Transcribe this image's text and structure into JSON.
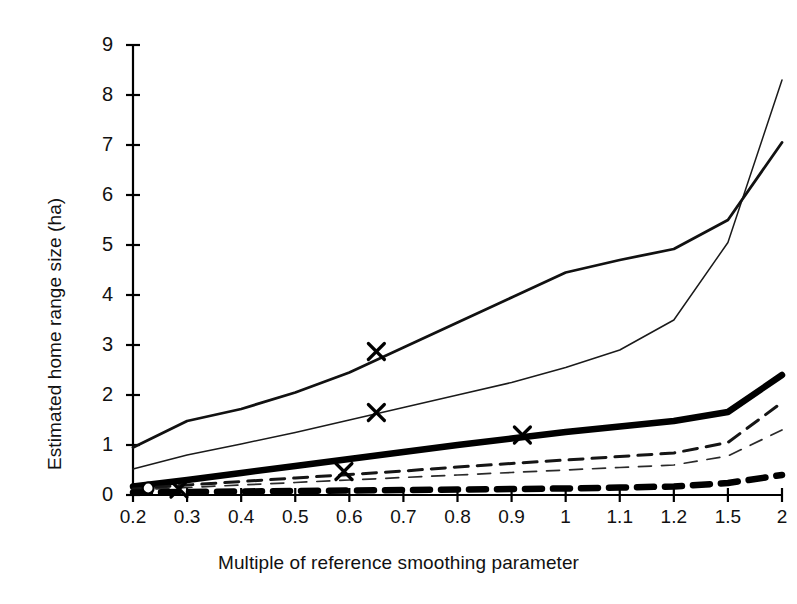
{
  "chart_data": {
    "type": "line",
    "title": "",
    "xlabel": "Multiple of reference smoothing parameter",
    "ylabel": "Estimated home range size (ha)",
    "categories": [
      "0.2",
      "0.3",
      "0.4",
      "0.5",
      "0.6",
      "0.7",
      "0.8",
      "0.9",
      "1",
      "1.1",
      "1.2",
      "1.5",
      "2"
    ],
    "x_tick_labels": [
      "0.2",
      "0.3",
      "0.4",
      "0.5",
      "0.6",
      "0.7",
      "0.8",
      "0.9",
      "1",
      "1.1",
      "1.2",
      "1.5",
      "2"
    ],
    "y_tick_labels": [
      "0",
      "1",
      "2",
      "3",
      "4",
      "5",
      "6",
      "7",
      "8",
      "9"
    ],
    "ylim": [
      0,
      9
    ],
    "ytick_step": 1,
    "grid": false,
    "legend": "none",
    "axis_color": "#000000",
    "series": [
      {
        "name": "thin-solid-steep",
        "style": "solid",
        "width": "thin",
        "color": "#1a1a1a",
        "values": [
          0.52,
          0.8,
          1.02,
          1.25,
          1.5,
          1.75,
          2.0,
          2.25,
          2.55,
          2.9,
          3.5,
          5.05,
          8.3
        ]
      },
      {
        "name": "medium-solid-upper",
        "style": "solid",
        "width": "medium",
        "color": "#111111",
        "values": [
          0.95,
          1.48,
          1.72,
          2.05,
          2.45,
          2.95,
          3.45,
          3.95,
          4.45,
          4.7,
          4.92,
          5.5,
          7.05
        ]
      },
      {
        "name": "thick-solid-middle",
        "style": "solid",
        "width": "thick",
        "color": "#000000",
        "values": [
          0.17,
          0.3,
          0.44,
          0.58,
          0.72,
          0.86,
          1.0,
          1.13,
          1.26,
          1.37,
          1.48,
          1.66,
          2.4
        ]
      },
      {
        "name": "thin-dashed-upper",
        "style": "dashed",
        "width": "medium-dash",
        "color": "#151515",
        "values": [
          0.12,
          0.2,
          0.27,
          0.34,
          0.41,
          0.48,
          0.56,
          0.63,
          0.7,
          0.77,
          0.84,
          1.05,
          1.85
        ]
      },
      {
        "name": "thin-dashed-lower",
        "style": "dashed",
        "width": "thin-dash",
        "color": "#2a2a2a",
        "values": [
          0.1,
          0.15,
          0.2,
          0.25,
          0.3,
          0.35,
          0.4,
          0.45,
          0.5,
          0.55,
          0.6,
          0.78,
          1.3
        ]
      },
      {
        "name": "thick-dashed-bottom",
        "style": "dashed",
        "width": "thick-dash",
        "color": "#000000",
        "values": [
          0.05,
          0.06,
          0.07,
          0.08,
          0.09,
          0.1,
          0.11,
          0.12,
          0.13,
          0.15,
          0.17,
          0.24,
          0.4
        ]
      }
    ],
    "markers": [
      {
        "name": "x-marker-medium-solid",
        "glyph": "x",
        "x_index": 4.5,
        "value": 2.87
      },
      {
        "name": "x-marker-thin-solid",
        "glyph": "x",
        "x_index": 4.5,
        "value": 1.65
      },
      {
        "name": "x-marker-thick-solid",
        "glyph": "x",
        "x_index": 7.2,
        "value": 1.2
      },
      {
        "name": "x-marker-thin-dashed",
        "glyph": "x",
        "x_index": 3.9,
        "value": 0.47
      },
      {
        "name": "x-marker-origin",
        "glyph": "x",
        "x_index": 0.85,
        "value": 0.12
      },
      {
        "name": "dot-marker-origin",
        "glyph": "circle",
        "x_index": 0.28,
        "value": 0.14
      }
    ]
  }
}
